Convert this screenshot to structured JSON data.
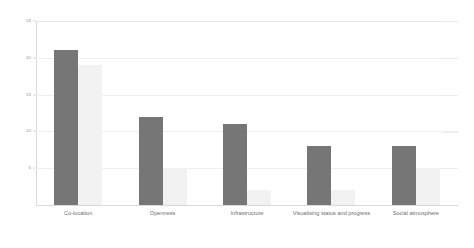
{
  "chart_data": {
    "type": "bar",
    "title": "",
    "xlabel": "",
    "ylabel": "",
    "ylim": [
      0,
      25
    ],
    "grid": true,
    "legend": "none",
    "categories": [
      "Co-location",
      "Openness",
      "Infrastructure",
      "Visualising status and progress",
      "Social atmosphere"
    ],
    "yticks": [
      25,
      20,
      15,
      10,
      5
    ],
    "ytick_labels": [
      "25",
      "20",
      "15",
      "10",
      "5"
    ],
    "series": [
      {
        "name": "Series 1",
        "color": "#767676",
        "values": [
          21,
          12,
          11,
          8,
          8
        ]
      },
      {
        "name": "Series 2",
        "color": "#f2f2f2",
        "values": [
          19,
          5,
          2,
          2,
          5
        ]
      }
    ]
  }
}
